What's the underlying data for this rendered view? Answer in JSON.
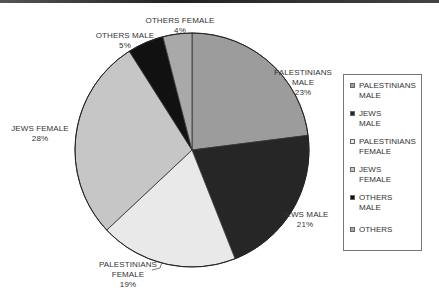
{
  "chart_data": {
    "type": "pie",
    "title": "",
    "categories": [
      "PALESTINIANS MALE",
      "JEWS MALE",
      "PALESTINIANS FEMALE",
      "JEWS FEMALE",
      "OTHERS MALE",
      "OTHERS FEMALE"
    ],
    "values": [
      23,
      21,
      19,
      28,
      5,
      4
    ],
    "unit": "%",
    "colors": [
      "#9c9c9c",
      "#262626",
      "#e9e9e9",
      "#c6c6c6",
      "#111111",
      "#a9a9a9"
    ],
    "start_angle": "12 o'clock",
    "direction": "clockwise",
    "legend_position": "right",
    "legend_entries": [
      "PALESTINIANS MALE",
      "JEWS MALE",
      "PALESTINIANS FEMALE",
      "JEWS FEMALE",
      "OTHERS MALE",
      "OTHERS"
    ]
  },
  "labels": [
    {
      "name": "PALESTINIANS\nMALE",
      "pct": "23%"
    },
    {
      "name": "JEWS MALE",
      "pct": "21%"
    },
    {
      "name": "PALESTINIANS\nFEMALE",
      "pct": "19%"
    },
    {
      "name": "JEWS FEMALE",
      "pct": "28%"
    },
    {
      "name": "OTHERS MALE",
      "pct": "5%"
    },
    {
      "name": "OTHERS FEMALE",
      "pct": "4%"
    }
  ],
  "legend": [
    {
      "label": "PALESTINIANS\nMALE",
      "color": "#9c9c9c"
    },
    {
      "label": "JEWS\nMALE",
      "color": "#262626"
    },
    {
      "label": "PALESTINIANS\nFEMALE",
      "color": "#e9e9e9"
    },
    {
      "label": "JEWS\nFEMALE",
      "color": "#c6c6c6"
    },
    {
      "label": "OTHERS\nMALE",
      "color": "#111111"
    },
    {
      "label": "OTHERS",
      "color": "#a9a9a9"
    }
  ]
}
